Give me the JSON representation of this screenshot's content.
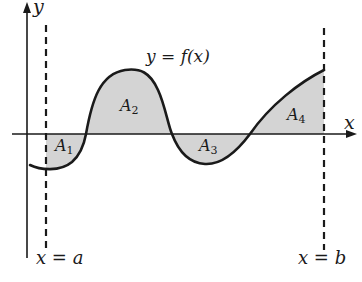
{
  "diagram": {
    "axes": {
      "x_label": "x",
      "y_label": "y"
    },
    "curve_label": "y = f(x)",
    "bounds": {
      "left": "x = a",
      "right": "x = b"
    },
    "regions": [
      {
        "name": "A",
        "index": "1",
        "position": "below x-axis",
        "shaded": true
      },
      {
        "name": "A",
        "index": "2",
        "position": "above x-axis",
        "shaded": true
      },
      {
        "name": "A",
        "index": "3",
        "position": "below x-axis",
        "shaded": true
      },
      {
        "name": "A",
        "index": "4",
        "position": "above x-axis",
        "shaded": true
      }
    ],
    "colors": {
      "line": "#1a1a1a",
      "shade": "#d4d4d4",
      "background": "#ffffff"
    }
  }
}
